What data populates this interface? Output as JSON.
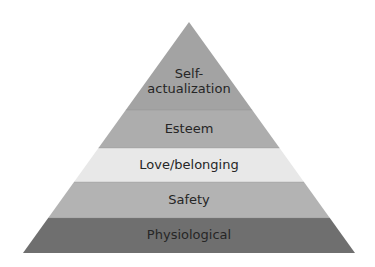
{
  "diagram": {
    "type": "pyramid",
    "title": "",
    "levels_top_to_bottom": [
      {
        "id": "self-actualization",
        "label_lines": [
          "Self-",
          "actualization"
        ],
        "color": "#a3a3a3"
      },
      {
        "id": "esteem",
        "label_lines": [
          "Esteem"
        ],
        "color": "#adadad"
      },
      {
        "id": "love-belonging",
        "label_lines": [
          "Love/belonging"
        ],
        "color": "#e8e8e8"
      },
      {
        "id": "safety",
        "label_lines": [
          "Safety"
        ],
        "color": "#b3b3b3"
      },
      {
        "id": "physiological",
        "label_lines": [
          "Physiological"
        ],
        "color": "#6f6f6f"
      }
    ],
    "text_color": "#262626",
    "divider_color": "#8a8a8a"
  }
}
